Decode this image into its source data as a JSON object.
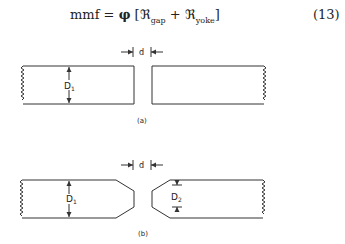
{
  "equation": {
    "lhs": "mmf",
    "equals": "=",
    "flux": "φ",
    "open": "[",
    "term1": "ℜ",
    "term1_sub": "gap",
    "plus": "+",
    "term2": "ℜ",
    "term2_sub": "yoke",
    "close": "]",
    "number": "(13)"
  },
  "figure_a": {
    "gap_label": "d",
    "dimension_label": "D",
    "dimension_sub": "1",
    "caption": "(a)"
  },
  "figure_b": {
    "gap_label": "d",
    "dimension1_label": "D",
    "dimension1_sub": "1",
    "dimension2_label": "D",
    "dimension2_sub": "2",
    "caption": "(b)"
  }
}
